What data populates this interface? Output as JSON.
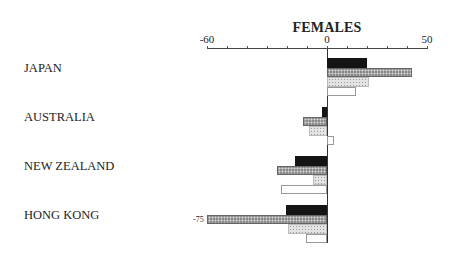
{
  "chart_data": {
    "type": "bar",
    "orientation": "horizontal",
    "title": "FEMALES",
    "xlabel": "",
    "ylabel": "",
    "xlim": [
      -60,
      50
    ],
    "x_tick_labels": [
      "-60",
      "0",
      "50"
    ],
    "tick_interval": 10,
    "grid": false,
    "legend": null,
    "categories": [
      "JAPAN",
      "AUSTRALIA",
      "NEW ZEALAND",
      "HONG KONG"
    ],
    "series": [
      {
        "name": "series-1 (solid black)",
        "values": [
          20,
          -2.5,
          -16,
          -20.5
        ]
      },
      {
        "name": "series-2 (dark hatched)",
        "values": [
          42.5,
          -12,
          -25,
          -75
        ]
      },
      {
        "name": "series-3 (light dotted)",
        "values": [
          21,
          -9,
          -7,
          -19.5
        ]
      },
      {
        "name": "series-4 (white)",
        "values": [
          14.5,
          3.5,
          -23,
          -10.5
        ]
      }
    ],
    "annotations": [
      {
        "text": "-75",
        "category": "HONG KONG",
        "series": "series-2 (dark hatched)",
        "note": "bar clipped at axis minimum -60"
      }
    ]
  },
  "layout": {
    "zero_x": 327,
    "px_per_unit": 2,
    "group_tops": [
      58,
      107,
      156,
      205
    ],
    "bar_height": 9.5
  }
}
